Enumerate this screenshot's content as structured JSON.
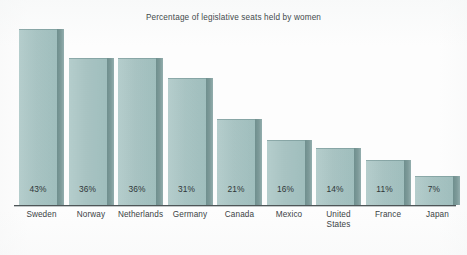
{
  "chart_data": {
    "type": "bar",
    "title": "Percentage of legislative seats held by women",
    "xlabel": "",
    "ylabel": "",
    "ylim": [
      0,
      43
    ],
    "grid": false,
    "legend": false,
    "orientation": "vertical",
    "value_label_suffix": "%",
    "value_label_position": "inside-bottom",
    "categories": [
      "Sweden",
      "Norway",
      "Netherlands",
      "Germany",
      "Canada",
      "Mexico",
      "United States",
      "France",
      "Japan"
    ],
    "values": [
      43,
      36,
      36,
      31,
      21,
      16,
      14,
      11,
      7
    ],
    "value_labels": [
      "43%",
      "36%",
      "36%",
      "31%",
      "21%",
      "16%",
      "14%",
      "11%",
      "7%"
    ]
  },
  "chart": {
    "title": "Percentage of legislative seats held by women",
    "bars": [
      {
        "category": "Sweden",
        "category_line1": "Sweden",
        "category_line2": "",
        "value": 43,
        "label": "43%"
      },
      {
        "category": "Norway",
        "category_line1": "Norway",
        "category_line2": "",
        "value": 36,
        "label": "36%"
      },
      {
        "category": "Netherlands",
        "category_line1": "Netherlands",
        "category_line2": "",
        "value": 36,
        "label": "36%"
      },
      {
        "category": "Germany",
        "category_line1": "Germany",
        "category_line2": "",
        "value": 31,
        "label": "31%"
      },
      {
        "category": "Canada",
        "category_line1": "Canada",
        "category_line2": "",
        "value": 21,
        "label": "21%"
      },
      {
        "category": "Mexico",
        "category_line1": "Mexico",
        "category_line2": "",
        "value": 16,
        "label": "16%"
      },
      {
        "category": "United States",
        "category_line1": "United",
        "category_line2": "States",
        "value": 14,
        "label": "14%"
      },
      {
        "category": "France",
        "category_line1": "France",
        "category_line2": "",
        "value": 11,
        "label": "11%"
      },
      {
        "category": "Japan",
        "category_line1": "Japan",
        "category_line2": "",
        "value": 7,
        "label": "7%"
      }
    ],
    "colors": {
      "bar_face": "#a6c2c1",
      "bar_side": "#7d9a99",
      "axis_line": "#4e5557",
      "title_text": "#434a4c",
      "label_text": "#3b4244",
      "value_text": "#2f3638",
      "background": "#fdfdfd"
    }
  }
}
